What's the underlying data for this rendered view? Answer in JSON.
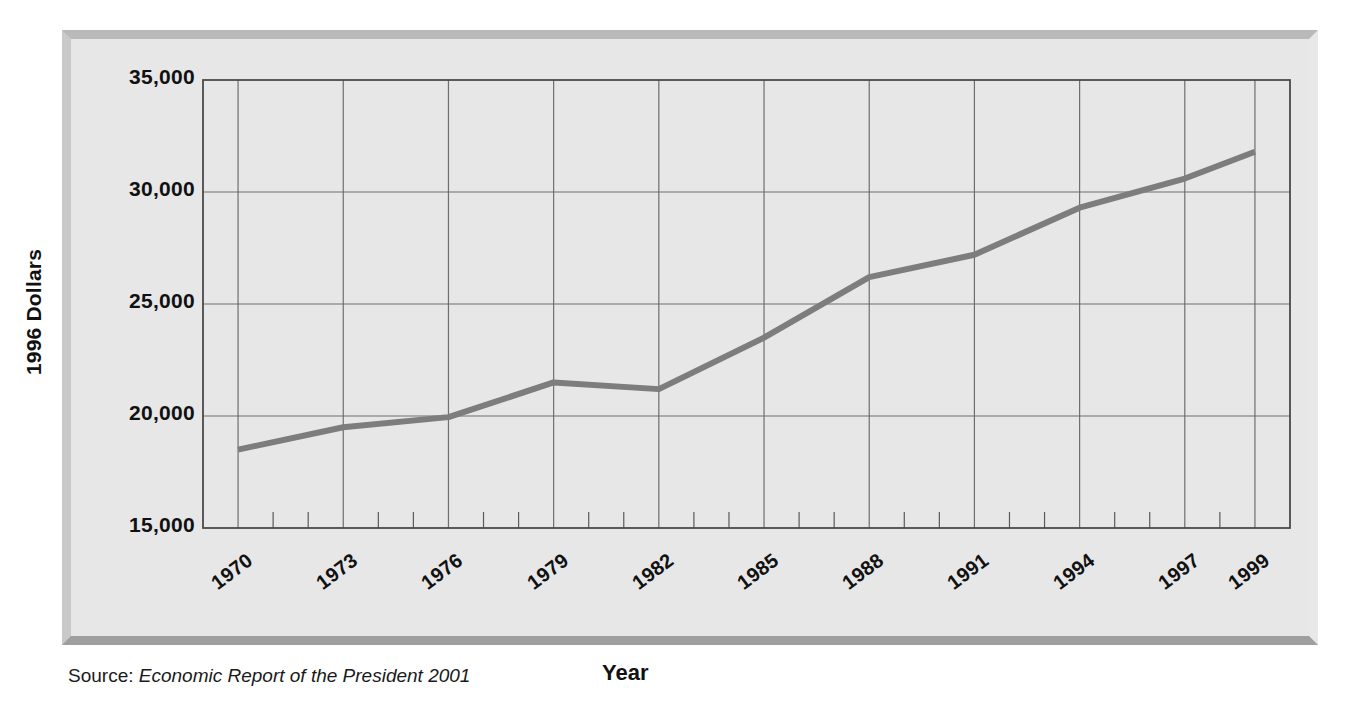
{
  "figure": {
    "y_axis_title": "1996 Dollars",
    "x_axis_title": "Year",
    "source_prefix": "Source:",
    "source_title": "Economic Report of the President 2001"
  },
  "chart_data": {
    "type": "line",
    "title": "",
    "xlabel": "Year",
    "ylabel": "1996 Dollars",
    "xlim": [
      1969,
      2000
    ],
    "ylim": [
      15000,
      35000
    ],
    "ytick_labels": [
      "35,000",
      "30,000",
      "25,000",
      "20,000",
      "15,000"
    ],
    "yticks": [
      35000,
      30000,
      25000,
      20000,
      15000
    ],
    "xtick_labels": [
      "1970",
      "1973",
      "1976",
      "1979",
      "1982",
      "1985",
      "1988",
      "1991",
      "1994",
      "1997",
      "1999"
    ],
    "xticks": [
      1970,
      1973,
      1976,
      1979,
      1982,
      1985,
      1988,
      1991,
      1994,
      1997,
      1999
    ],
    "grid": true,
    "minor_ticks": true,
    "legend": false,
    "line_color": "#7d7d7d",
    "line_width": 6,
    "series": [
      {
        "name": "Real disposable personal income per capita",
        "x": [
          1970,
          1973,
          1976,
          1979,
          1982,
          1985,
          1988,
          1991,
          1994,
          1997,
          1999
        ],
        "values": [
          18500,
          19500,
          19950,
          21500,
          21200,
          23500,
          26200,
          27200,
          29300,
          30600,
          31800
        ]
      }
    ]
  }
}
